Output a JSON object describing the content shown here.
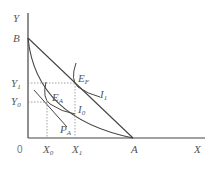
{
  "diagram": {
    "axes": {
      "y_label": "Y",
      "x_label": "X",
      "origin": "0"
    },
    "points": {
      "B": "B",
      "A": "A",
      "E_F": {
        "main": "E",
        "sub": "F"
      },
      "E_A": {
        "main": "E",
        "sub": "A"
      },
      "P_A": {
        "main": "P",
        "sub": "A"
      }
    },
    "curves": {
      "I1": {
        "main": "I",
        "sub": "1"
      },
      "I0": {
        "main": "I",
        "sub": "0"
      }
    },
    "y_ticks": [
      {
        "main": "Y",
        "sub": "1"
      },
      {
        "main": "Y",
        "sub": "0"
      }
    ],
    "x_ticks": [
      {
        "main": "X",
        "sub": "0"
      },
      {
        "main": "X",
        "sub": "1"
      }
    ],
    "colors": {
      "line": "#444444",
      "dashed": "#888888",
      "text": "#555555"
    }
  }
}
